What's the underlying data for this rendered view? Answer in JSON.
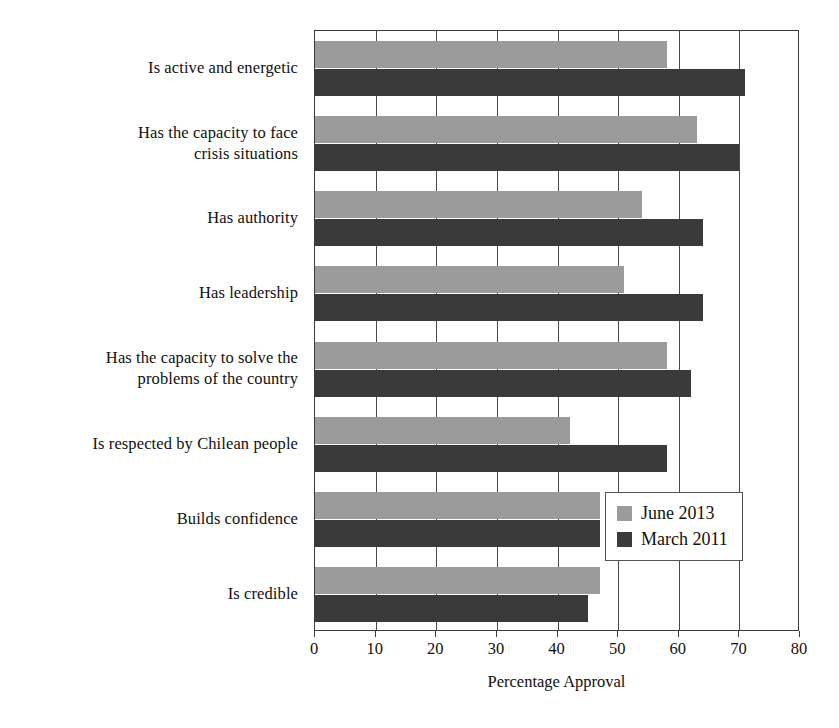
{
  "chart_data": {
    "type": "bar",
    "orientation": "horizontal",
    "title": "",
    "xlabel": "Percentage Approval",
    "ylabel": "",
    "xlim": [
      0,
      80
    ],
    "xticks": [
      0,
      10,
      20,
      30,
      40,
      50,
      60,
      70,
      80
    ],
    "grid": true,
    "legend_position": "inside-right-lower",
    "categories": [
      "Is active and energetic",
      "Has the capacity to face crisis situations",
      "Has authority",
      "Has leadership",
      "Has the capacity to solve the problems of the country",
      "Is respected by Chilean people",
      "Builds confidence",
      "Is credible"
    ],
    "category_lines": [
      [
        "Is active and energetic"
      ],
      [
        "Has the capacity to face",
        "crisis situations"
      ],
      [
        "Has authority"
      ],
      [
        "Has leadership"
      ],
      [
        "Has the capacity to solve the",
        "problems of the country"
      ],
      [
        "Is respected by Chilean people"
      ],
      [
        "Builds confidence"
      ],
      [
        "Is credible"
      ]
    ],
    "series": [
      {
        "name": "June 2013",
        "color": "#9b9b9b",
        "values": [
          58,
          63,
          54,
          51,
          58,
          42,
          47,
          47
        ]
      },
      {
        "name": "March 2011",
        "color": "#3a3a3a",
        "values": [
          71,
          70,
          64,
          64,
          62,
          58,
          47,
          45
        ]
      }
    ]
  },
  "legend": {
    "entries": [
      {
        "label": "June 2013"
      },
      {
        "label": "March 2011"
      }
    ]
  },
  "axis": {
    "x_title": "Percentage Approval",
    "tick_labels": [
      "0",
      "10",
      "20",
      "30",
      "40",
      "50",
      "60",
      "70",
      "80"
    ]
  }
}
